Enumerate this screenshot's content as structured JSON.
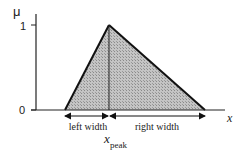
{
  "diagram": {
    "y_axis": {
      "label": "μ",
      "ticks": [
        {
          "label": "1",
          "value": 1
        },
        {
          "label": "0",
          "value": 0
        }
      ]
    },
    "x_axis": {
      "label": "x"
    },
    "triangle": {
      "fill_color": "#b8b8b8",
      "stroke_color": "#111111",
      "peak_value": 1
    },
    "annotations": {
      "left_width": "left width",
      "right_width": "right width",
      "peak_label_main": "x",
      "peak_label_sub": "peak"
    }
  }
}
